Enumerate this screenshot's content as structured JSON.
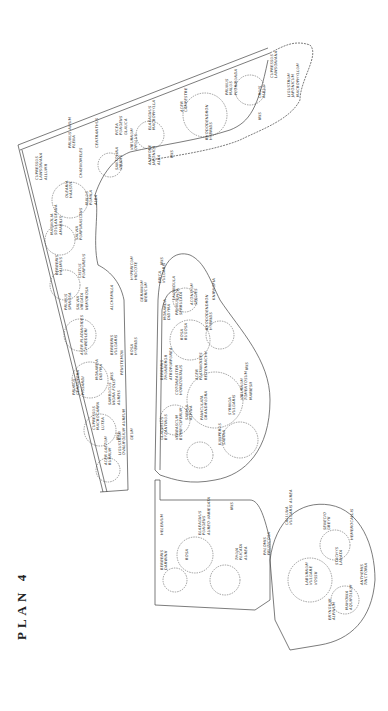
{
  "title": "PLAN 4",
  "colors": {
    "ink": "#333333",
    "paper": "#ffffff"
  },
  "labels": [
    {
      "id": "cupressus-lawsoniana-r",
      "lines": [
        "CUPRESSUS",
        "LAWSONIANA"
      ],
      "x": 270,
      "y": 78
    },
    {
      "id": "ligustrum",
      "lines": [
        "LIGUSTRUM",
        "JAPONICUM",
        "MACROPHYLLUM"
      ],
      "x": 287,
      "y": 97
    },
    {
      "id": "prunus-malus",
      "lines": [
        "PRUNUS",
        "MALUS",
        "FLORIBUNDA"
      ],
      "x": 225,
      "y": 95
    },
    {
      "id": "cruis-albus",
      "lines": [
        "CRUIS",
        "ALBUS"
      ],
      "x": 258,
      "y": 98
    },
    {
      "id": "iris-r",
      "lines": [
        "IRIS"
      ],
      "x": 258,
      "y": 120
    },
    {
      "id": "acer-campestre",
      "lines": [
        "ACER",
        "CAMPESTRE"
      ],
      "x": 180,
      "y": 112
    },
    {
      "id": "rhododendron-hybrid-r",
      "lines": [
        "RHODODENDRON",
        "HYBRIDS"
      ],
      "x": 205,
      "y": 140
    },
    {
      "id": "elaeagnus",
      "lines": [
        "ELAEAGNUS",
        "MACROPHYLLA"
      ],
      "x": 148,
      "y": 130
    },
    {
      "id": "picea",
      "lines": [
        "PICEA",
        "PUNGENS",
        "GLAUCA"
      ],
      "x": 115,
      "y": 135
    },
    {
      "id": "viburnum",
      "lines": [
        "VIBURNUM",
        "OPULUS"
      ],
      "x": 130,
      "y": 150
    },
    {
      "id": "iris-r2",
      "lines": [
        "IRIS"
      ],
      "x": 170,
      "y": 158
    },
    {
      "id": "anemone",
      "lines": [
        "ANEMONE",
        "JAPONICA",
        "ALBA"
      ],
      "x": 148,
      "y": 165
    },
    {
      "id": "centranthus",
      "lines": [
        "CENTRANTHUS"
      ],
      "x": 95,
      "y": 148
    },
    {
      "id": "santolina",
      "lines": [
        "SANTOLINA",
        "VIRIDIS"
      ],
      "x": 115,
      "y": 170
    },
    {
      "id": "prunus-avium",
      "lines": [
        "PRUNUS AVIUM",
        "PLENA"
      ],
      "x": 68,
      "y": 148
    },
    {
      "id": "chaenomeles",
      "lines": [
        "CHAENOMELES",
        ""
      ],
      "x": 79,
      "y": 178
    },
    {
      "id": "cupressus-allumii",
      "lines": [
        "CUPRESSUS",
        "LAWSONIANA",
        "ALLUMII"
      ],
      "x": 35,
      "y": 180
    },
    {
      "id": "olearia",
      "lines": [
        "OLEARIA",
        "HAASTII"
      ],
      "x": 65,
      "y": 198
    },
    {
      "id": "malus-alba",
      "lines": [
        "MALUS",
        "PUMILA",
        "ALBA"
      ],
      "x": 85,
      "y": 205
    },
    {
      "id": "magnolia",
      "lines": [
        "MAGNOLIA",
        "SOULANGEANA",
        "AMABILIS"
      ],
      "x": 50,
      "y": 235
    },
    {
      "id": "salvia",
      "lines": [
        "SALVIA",
        "PURPURASCENS"
      ],
      "x": 75,
      "y": 240
    },
    {
      "id": "berberis-halimus",
      "lines": [
        "BERBERIS",
        "HALIMUS"
      ],
      "x": 55,
      "y": 275
    },
    {
      "id": "cistus",
      "lines": [
        "CISTUS",
        "PURPUREUS"
      ],
      "x": 78,
      "y": 278
    },
    {
      "id": "prunus-spinosa",
      "lines": [
        "PRUNUS",
        "SPINOSA"
      ],
      "x": 64,
      "y": 310
    },
    {
      "id": "salvia-virgata",
      "lines": [
        "SALVIA",
        "VIRGATA",
        "NEMOROSA"
      ],
      "x": 76,
      "y": 310
    },
    {
      "id": "alchemilla",
      "lines": [
        "ALCHEMILLA"
      ],
      "x": 110,
      "y": 310
    },
    {
      "id": "acer-platanoides",
      "lines": [
        "ACER PLATANOIDES",
        "SCHWEDLERI"
      ],
      "x": 80,
      "y": 355
    },
    {
      "id": "berberis-vulgaris",
      "lines": [
        "BERBERIS",
        "VULGARIS"
      ],
      "x": 110,
      "y": 355
    },
    {
      "id": "monarda",
      "lines": [
        "MONARDA",
        "DIDYMA"
      ],
      "x": 95,
      "y": 380
    },
    {
      "id": "iris-l",
      "lines": [
        "IRIS"
      ],
      "x": 110,
      "y": 380
    },
    {
      "id": "penstemon",
      "lines": [
        "PENSTEMON"
      ],
      "x": 120,
      "y": 375
    },
    {
      "id": "prunus-cerasifera",
      "lines": [
        "PRUNUS",
        "CERASIFERA",
        "PISSARDI"
      ],
      "x": 72,
      "y": 395
    },
    {
      "id": "cupressus-macrocarpa",
      "lines": [
        "CUPRESSUS",
        "MACROCARPA",
        "LUTEA"
      ],
      "x": 92,
      "y": 430
    },
    {
      "id": "sambucus",
      "lines": [
        "SAMBUCUS",
        "NIGRA FOLIS",
        "AUREIS"
      ],
      "x": 108,
      "y": 405
    },
    {
      "id": "iris-l2",
      "lines": [
        "IRIS"
      ],
      "x": 116,
      "y": 440
    },
    {
      "id": "ligustrum-ovalifolium",
      "lines": [
        "LIGUSTRUM",
        "OVALIFOLIUM AUREUM"
      ],
      "x": 118,
      "y": 455
    },
    {
      "id": "acer-laetum",
      "lines": [
        "ACER LAETUM",
        "RUBRUM"
      ],
      "x": 104,
      "y": 465
    },
    {
      "id": "geum",
      "lines": [
        "GEUM"
      ],
      "x": 130,
      "y": 440
    },
    {
      "id": "rosa-hybrid",
      "lines": [
        "ROSA",
        "HYBRIDS"
      ],
      "x": 130,
      "y": 355
    },
    {
      "id": "geranium",
      "lines": [
        "GERANIUM",
        "IBERICUM"
      ],
      "x": 140,
      "y": 302
    },
    {
      "id": "hypericum",
      "lines": [
        "HYPERICUM",
        "HIDCOTE"
      ],
      "x": 130,
      "y": 280
    },
    {
      "id": "erica",
      "lines": [
        "ERICA",
        "VULGARIS"
      ],
      "x": 158,
      "y": 283
    },
    {
      "id": "iris-c",
      "lines": [
        "IRIS"
      ],
      "x": 160,
      "y": 265
    },
    {
      "id": "lavandula",
      "lines": [
        "LAVANDULA",
        "SPICA"
      ],
      "x": 172,
      "y": 300
    },
    {
      "id": "kniphofia",
      "lines": [
        "KNIPHOFIA"
      ],
      "x": 212,
      "y": 300
    },
    {
      "id": "monarda-c",
      "lines": [
        "MONARDA",
        "DIDYMA"
      ],
      "x": 163,
      "y": 320
    },
    {
      "id": "prunus-c",
      "lines": [
        "PRUNUS",
        "SERRULATA"
      ],
      "x": 175,
      "y": 315
    },
    {
      "id": "aconitum",
      "lines": [
        "ACONITUM",
        "SPECIES"
      ],
      "x": 190,
      "y": 305
    },
    {
      "id": "rhododendron-c",
      "lines": [
        "RHODODENDRON",
        "HYBRIDS"
      ],
      "x": 205,
      "y": 330
    },
    {
      "id": "rosa-rugosa",
      "lines": [
        "ROSA",
        "RUGOSA"
      ],
      "x": 180,
      "y": 340
    },
    {
      "id": "acer-c",
      "lines": [
        "ACER",
        "PLATANOIDES",
        "REITENBACHII"
      ],
      "x": 195,
      "y": 380
    },
    {
      "id": "iris-c2",
      "lines": [
        "IRIS"
      ],
      "x": 245,
      "y": 370
    },
    {
      "id": "viburnum-c",
      "lines": [
        "VIBURNUM",
        "TOMENTOSUM",
        "MARIESII"
      ],
      "x": 240,
      "y": 400
    },
    {
      "id": "berberis-c",
      "lines": [
        "BERBERIS",
        "THUNBERGII",
        "ATROPURPUREA"
      ],
      "x": 160,
      "y": 380
    },
    {
      "id": "cotoneaster",
      "lines": [
        "COTONEASTER",
        "HORIZONTALIS"
      ],
      "x": 175,
      "y": 395
    },
    {
      "id": "sabina",
      "lines": [
        "SABINA",
        "ALPINA"
      ],
      "x": 185,
      "y": 420
    },
    {
      "id": "paniculata",
      "lines": [
        "PANICULATA",
        "GRANDIFLORA"
      ],
      "x": 200,
      "y": 420
    },
    {
      "id": "syringa",
      "lines": [
        "SYRINGA",
        "VULGARIS"
      ],
      "x": 228,
      "y": 415
    },
    {
      "id": "juniperus",
      "lines": [
        "JUNIPERUS",
        "SABINA"
      ],
      "x": 218,
      "y": 445
    },
    {
      "id": "gladiolus",
      "lines": [
        "GLADIOLUS",
        "BYZANTINUS"
      ],
      "x": 160,
      "y": 440
    },
    {
      "id": "verbascum",
      "lines": [
        "VERBASCUM",
        "BOMBYCIFERUM"
      ],
      "x": 175,
      "y": 440
    },
    {
      "id": "berberis-darwinii",
      "lines": [
        "BERBERIS",
        "DARWINII"
      ],
      "x": 160,
      "y": 570
    },
    {
      "id": "helenium",
      "lines": [
        "HELENIUM"
      ],
      "x": 160,
      "y": 535
    },
    {
      "id": "rosa-l",
      "lines": [
        "ROSA"
      ],
      "x": 185,
      "y": 560
    },
    {
      "id": "eleagnus-l",
      "lines": [
        "ELAEAGNUS",
        "PUNGENS",
        "AUREO-VARIEGATA"
      ],
      "x": 198,
      "y": 535
    },
    {
      "id": "iris-l3",
      "lines": [
        "IRIS"
      ],
      "x": 230,
      "y": 510
    },
    {
      "id": "thuja",
      "lines": [
        "THUJA",
        "PLICATA",
        "AUREA"
      ],
      "x": 235,
      "y": 560
    },
    {
      "id": "phlomis",
      "lines": [
        "PHLOMIS",
        "FRUTICOSA"
      ],
      "x": 263,
      "y": 555
    },
    {
      "id": "calluna",
      "lines": [
        "CALLUNA",
        "VULGARIS AUREA"
      ],
      "x": 285,
      "y": 525
    },
    {
      "id": "senecio",
      "lines": [
        "SENECIO",
        "GREYII"
      ],
      "x": 323,
      "y": 530
    },
    {
      "id": "labunum",
      "lines": [
        "LABURNUM",
        "VULGARE",
        "VOSSII"
      ],
      "x": 305,
      "y": 585
    },
    {
      "id": "hemerocallis",
      "lines": [
        "HEMEROCALLIS"
      ],
      "x": 350,
      "y": 540
    },
    {
      "id": "stachys",
      "lines": [
        "STACHYS",
        "LANATA"
      ],
      "x": 335,
      "y": 565
    },
    {
      "id": "anthemis",
      "lines": [
        "ANTHEMIS",
        "TINCTORIA"
      ],
      "x": 360,
      "y": 585
    },
    {
      "id": "eryngium",
      "lines": [
        "ERYNGIUM",
        "ALPINUM"
      ],
      "x": 328,
      "y": 620
    },
    {
      "id": "mahonia",
      "lines": [
        "MAHONIA",
        "AQUIFOLIUM"
      ],
      "x": 345,
      "y": 610
    }
  ]
}
